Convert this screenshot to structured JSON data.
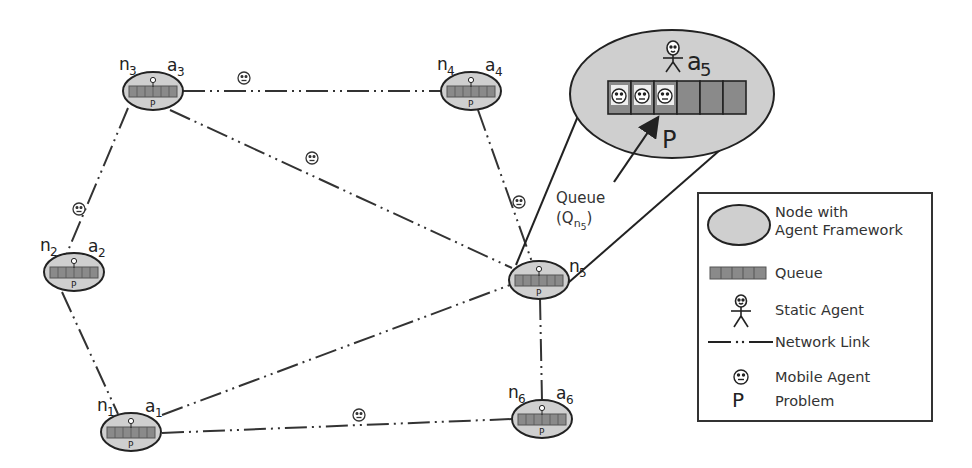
{
  "diagram": {
    "nodes": [
      {
        "id": "n1",
        "label": "n",
        "sub": "1",
        "agent": "a",
        "agent_sub": "1",
        "x": 131,
        "y": 432,
        "problem": "P"
      },
      {
        "id": "n2",
        "label": "n",
        "sub": "2",
        "agent": "a",
        "agent_sub": "2",
        "x": 74,
        "y": 272,
        "problem": "P"
      },
      {
        "id": "n3",
        "label": "n",
        "sub": "3",
        "agent": "a",
        "agent_sub": "3",
        "x": 153,
        "y": 91,
        "problem": "P"
      },
      {
        "id": "n4",
        "label": "n",
        "sub": "4",
        "agent": "a",
        "agent_sub": "4",
        "x": 471,
        "y": 91,
        "problem": "P"
      },
      {
        "id": "n5",
        "label": "n",
        "sub": "5",
        "agent": "a",
        "agent_sub": "5",
        "x": 539,
        "y": 280,
        "problem": "P"
      },
      {
        "id": "n6",
        "label": "n",
        "sub": "6",
        "agent": "a",
        "agent_sub": "6",
        "x": 542,
        "y": 419,
        "problem": "P"
      }
    ],
    "links": [
      {
        "from": "n3",
        "to": "n4",
        "mobile_agent": true,
        "agent_x": 244,
        "agent_y": 78
      },
      {
        "from": "n3",
        "to": "n2",
        "mobile_agent": true,
        "agent_x": 80,
        "agent_y": 209
      },
      {
        "from": "n3",
        "to": "n5",
        "mobile_agent": true,
        "agent_x": 312,
        "agent_y": 158
      },
      {
        "from": "n4",
        "to": "n5",
        "mobile_agent": true,
        "agent_x": 520,
        "agent_y": 202
      },
      {
        "from": "n2",
        "to": "n1",
        "mobile_agent": false
      },
      {
        "from": "n1",
        "to": "n5",
        "mobile_agent": false
      },
      {
        "from": "n1",
        "to": "n6",
        "mobile_agent": true,
        "agent_x": 360,
        "agent_y": 415
      },
      {
        "from": "n5",
        "to": "n6",
        "mobile_agent": false
      }
    ],
    "zoom_view": {
      "of_node": "n5",
      "agent": "a",
      "agent_sub": "5",
      "queue_slots": 6,
      "queue_filled": 3,
      "problem": "P"
    },
    "callout": {
      "line1": "Queue",
      "line2_prefix": "(Q",
      "line2_sub": "n",
      "line2_subsub": "5",
      "line2_suffix": ")"
    }
  },
  "legend": {
    "items": [
      {
        "symbol": "node-ellipse",
        "label_line1": "Node with",
        "label_line2": "Agent Framework"
      },
      {
        "symbol": "queue-bar",
        "label_line1": "Queue"
      },
      {
        "symbol": "static-agent",
        "label_line1": "Static Agent"
      },
      {
        "symbol": "network-link",
        "label_line1": "Network Link"
      },
      {
        "symbol": "mobile-agent",
        "label_line1": "Mobile Agent"
      },
      {
        "symbol": "problem-P",
        "label_line1": "Problem",
        "glyph": "P"
      }
    ]
  },
  "colors": {
    "node_fill": "#cfcfcf",
    "queue_fill": "#8a8a8a",
    "stroke": "#222222",
    "background": "#ffffff"
  }
}
